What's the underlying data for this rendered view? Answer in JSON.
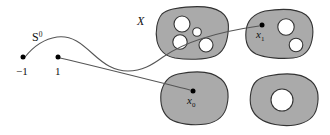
{
  "figure": {
    "colors": {
      "blob_fill": "#aaaaaa",
      "blob_stroke": "#333333",
      "hole_fill": "#ffffff",
      "curve_stroke": "#555555",
      "dot_fill": "#000000",
      "background": "#ffffff"
    },
    "labels": {
      "sphere": "S",
      "sphere_exponent": "0",
      "space": "X",
      "point_minus_one": "−1",
      "point_one": "1",
      "image_x1_base": "x",
      "image_x1_sub": "1",
      "image_x0_base": "x",
      "image_x0_sub": "0"
    },
    "domain_points": [
      {
        "name": "minus-one",
        "label": "−1",
        "cx": 23,
        "cy": 58
      },
      {
        "name": "one",
        "label": "1",
        "cx": 58,
        "cy": 58
      }
    ],
    "image_points": [
      {
        "name": "x1",
        "base": "x",
        "sub": "1",
        "cx": 262,
        "cy": 25
      },
      {
        "name": "x0",
        "base": "x",
        "sub": "0",
        "cx": 193,
        "cy": 91
      }
    ],
    "blobs": [
      {
        "name": "blob-top-left",
        "hole_count": 4,
        "holes": [
          {
            "cx": 182,
            "cy": 24,
            "r": 8.0
          },
          {
            "cx": 197,
            "cy": 32,
            "r": 4.3
          },
          {
            "cx": 180,
            "cy": 42,
            "r": 7.2
          },
          {
            "cx": 206,
            "cy": 45,
            "r": 7.0
          }
        ]
      },
      {
        "name": "blob-top-right",
        "hole_count": 2,
        "holes": [
          {
            "cx": 286,
            "cy": 27,
            "r": 8.2
          },
          {
            "cx": 296,
            "cy": 45,
            "r": 6.8
          }
        ]
      },
      {
        "name": "blob-bottom-left",
        "hole_count": 0,
        "holes": []
      },
      {
        "name": "blob-bottom-right",
        "hole_count": 1,
        "holes": [
          {
            "cx": 282,
            "cy": 100,
            "r": 11.0
          }
        ]
      }
    ]
  }
}
